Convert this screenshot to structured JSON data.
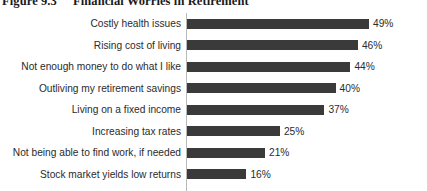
{
  "figure": {
    "number_label": "Figure 9.3",
    "title": "Financial Worries in Retirement"
  },
  "chart_data": {
    "type": "bar",
    "orientation": "horizontal",
    "title": "Financial Worries in Retirement",
    "xlabel": "",
    "ylabel": "",
    "xlim": [
      0,
      49
    ],
    "grid": false,
    "legend": null,
    "value_suffix": "%",
    "bar_color": "#3a3a3a",
    "axis_color": "#b9b9b9",
    "categories": [
      "Costly health issues",
      "Rising cost of living",
      "Not enough money to do what I like",
      "Outliving my retirement savings",
      "Living on a fixed income",
      "Increasing tax rates",
      "Not being able to find work, if needed",
      "Stock market yields low returns"
    ],
    "values": [
      49,
      46,
      44,
      40,
      37,
      25,
      21,
      16
    ],
    "value_labels": [
      "49%",
      "46%",
      "44%",
      "40%",
      "37%",
      "25%",
      "21%",
      "16%"
    ]
  }
}
